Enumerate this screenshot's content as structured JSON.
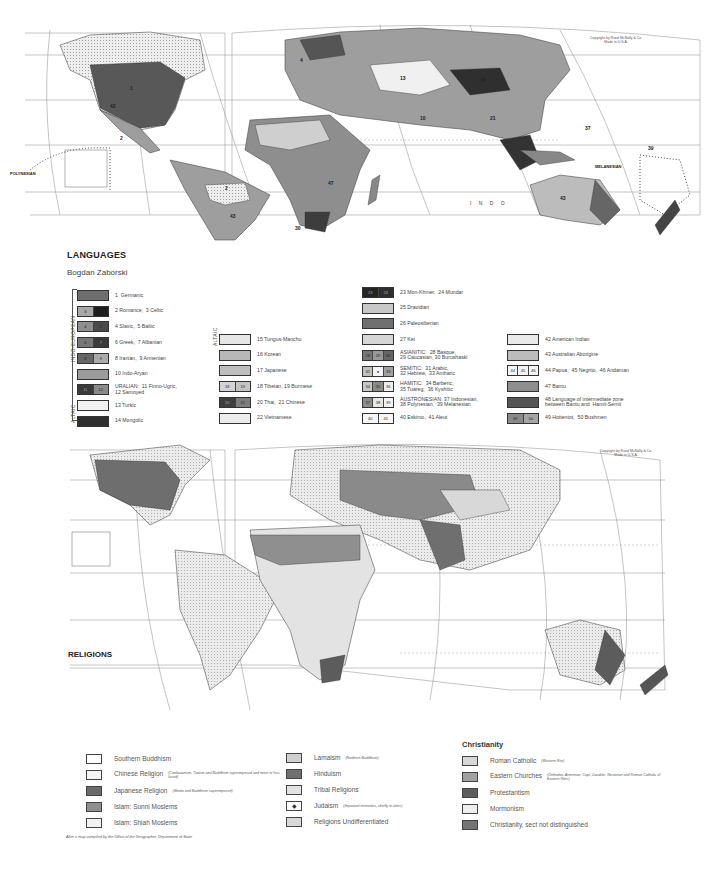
{
  "languages_map": {
    "title": "LANGUAGES",
    "author": "Bogdan Zaborski",
    "copyright": [
      "Copyright by Rand McNally & Co.",
      "Made in U.S.A."
    ],
    "ocean_labels": {
      "indo": "I N D O",
      "polynesian": "POLYNESIAN",
      "melanesian": "MELANESIAN",
      "polynesian_vertical": "POLYNESIAN",
      "equator": "Equator",
      "tropic_cancer": "Tropic of Cancer",
      "tropic_capricorn": "Tropic of Capricorn",
      "longitude_98w": "98 W"
    },
    "region_numbers": [
      "1",
      "2",
      "3",
      "4",
      "10",
      "13",
      "14",
      "15",
      "16",
      "21",
      "25",
      "27",
      "28",
      "31",
      "33",
      "34",
      "37",
      "38",
      "39",
      "40",
      "41",
      "42",
      "43",
      "44",
      "45",
      "46",
      "47",
      "48",
      "49",
      "50"
    ],
    "legend": {
      "group_indo_european": "INDO-EUROPEAN",
      "group_altaic_1": "ALTAIC",
      "group_altaic_2": "ALTAIC",
      "col1": [
        {
          "nums": [
            ""
          ],
          "label": "1  Germanic",
          "colors": [
            "#6e6e6e"
          ]
        },
        {
          "nums": [
            "3",
            ""
          ],
          "label": "2 Romance,  3 Celtic",
          "colors": [
            "#a9a9a9",
            "#1e1e1e"
          ]
        },
        {
          "nums": [
            "4",
            "5"
          ],
          "label": "4 Slavic,  5 Baltic",
          "colors": [
            "#8f8f8f",
            "#4a4a4a"
          ]
        },
        {
          "nums": [
            "6",
            "7"
          ],
          "label": "6 Greek,  7 Albanian",
          "colors": [
            "#777",
            "#3a3a3a"
          ]
        },
        {
          "nums": [
            "8",
            "9"
          ],
          "label": "8 Iranian,  9 Armenian",
          "colors": [
            "#666",
            "#aaa"
          ]
        },
        {
          "nums": [
            ""
          ],
          "label": "10 Indo-Aryan",
          "colors": [
            "#9b9b9b"
          ]
        },
        {
          "nums": [
            "11",
            "12"
          ],
          "label": "URALIAN:  11 Finno-Ugric,\n12 Samoyed",
          "colors": [
            "#3a3a3a",
            "#8a8a8a"
          ]
        },
        {
          "nums": [
            ""
          ],
          "label": "13 Turkic",
          "colors": [
            "#f0f0f0"
          ]
        },
        {
          "nums": [
            ""
          ],
          "label": "14 Mongolic",
          "colors": [
            "#2f2f2f"
          ]
        }
      ],
      "col2": [
        {
          "nums": [
            ""
          ],
          "label": "15 Tungus-Manchu",
          "colors": [
            "#e6e6e6"
          ]
        },
        {
          "nums": [
            ""
          ],
          "label": "16 Korean",
          "colors": [
            "#b8b8b8"
          ]
        },
        {
          "nums": [
            ""
          ],
          "label": "17 Japanese",
          "colors": [
            "#bdbdbd"
          ]
        },
        {
          "nums": [
            "18",
            "19"
          ],
          "label": "18 Tibetan, 19 Burmese",
          "colors": [
            "#d4d4d4",
            "#c4c4c4"
          ]
        },
        {
          "nums": [
            "20",
            "21"
          ],
          "label": "20 Thai,  21 Chinese",
          "colors": [
            "#3f3f3f",
            "#7e7e7e"
          ]
        },
        {
          "nums": [
            ""
          ],
          "label": "22 Vietnamese",
          "colors": [
            "#ececec"
          ]
        }
      ],
      "col3": [
        {
          "nums": [
            "23",
            "24"
          ],
          "label": "23 Mon-Khmer,  24 Mundar",
          "colors": [
            "#242424",
            "#2e2e2e"
          ]
        },
        {
          "nums": [
            ""
          ],
          "label": "25 Dravidian",
          "colors": [
            "#c8c8c8"
          ]
        },
        {
          "nums": [
            ""
          ],
          "label": "26 Paleosiberian",
          "colors": [
            "#707070"
          ]
        },
        {
          "nums": [
            ""
          ],
          "label": "27 Ket",
          "colors": [
            "#d6d6d6"
          ]
        },
        {
          "nums": [
            "28",
            "29",
            "30"
          ],
          "label": "ASIANITIC:  28 Basque,\n29 Caucasian, 30 Burushaski",
          "colors": [
            "#777",
            "#999",
            "#666"
          ]
        },
        {
          "nums": [
            "31",
            "●",
            "33"
          ],
          "label": "SEMITIC:  31 Arabic,\n32 Hebrew,  33 Amharic",
          "colors": [
            "#c0c0c0",
            "#f4f4f4",
            "#a0a0a0"
          ]
        },
        {
          "nums": [
            "34",
            "35",
            "36"
          ],
          "label": "HAMITIC:  34 Barberic,\n35 Tuareg,  36 Kyshitic",
          "colors": [
            "#c8c8c8",
            "#8a8a8a",
            "#eee"
          ]
        },
        {
          "nums": [
            "37",
            "38",
            "39"
          ],
          "label": "AUSTRONESIAN: 37 Indonesian,\n38 Polynesian,  39 Melanesian",
          "colors": [
            "#8c8c8c",
            "#e8e8e8",
            "#f2f2f2"
          ]
        },
        {
          "nums": [
            "40",
            "41"
          ],
          "label": "40 Eskimo,  41 Aleut",
          "colors": [
            "#f7f7f7",
            "#f7f7f7"
          ]
        }
      ],
      "col4": [
        {
          "nums": [
            ""
          ],
          "label": "42 American Indian",
          "colors": [
            "#eaeaea"
          ]
        },
        {
          "nums": [
            ""
          ],
          "label": "43 Australian Aborigine",
          "colors": [
            "#bcbcbc"
          ]
        },
        {
          "nums": [
            "44",
            "45",
            "46"
          ],
          "label": "44 Papua,  45 Negrito,  46 Andaman",
          "colors": [
            "#f5f5f5",
            "#f5f5f5",
            "#f5f5f5"
          ]
        },
        {
          "nums": [
            ""
          ],
          "label": "47 Bantu",
          "colors": [
            "#8e8e8e"
          ]
        },
        {
          "nums": [
            ""
          ],
          "label": "48 Language of intermediate zone\nbetween Bantu and  Hamit-Semit",
          "colors": [
            "#555"
          ]
        },
        {
          "nums": [
            "49",
            "50"
          ],
          "label": "49 Hottentot,  50 Bushmen",
          "colors": [
            "#8a8a8a",
            "#a5a5a5"
          ]
        }
      ]
    }
  },
  "religions_map": {
    "title": "RELIGIONS",
    "copyright": [
      "Copyright by Rand McNally & Co.",
      "Made in U.S.A."
    ],
    "map_labels": {
      "tropic_cancer": "Tropic of Cancer",
      "tropic_capricorn": "Tropic of Capricorn",
      "equator": "Equator",
      "longitude_98w": "98 W"
    },
    "legend": {
      "col1": [
        {
          "label": "Southern Buddhism",
          "note": "",
          "color": "#ffffff"
        },
        {
          "label": "Chinese Religion",
          "note": "(Confucianism, Taoism and Buddhism superimposed and more or less fused)",
          "color": "#f6f6f6"
        },
        {
          "label": "Japanese Religion",
          "note": "(Shinto and Buddhism superimposed)",
          "color": "#6a6a6a"
        },
        {
          "label": "Islam: Sunni Moslems",
          "note": "",
          "color": "#8f8f8f"
        },
        {
          "label": "Islam: Shiah Moslems",
          "note": "",
          "color": "#f2f2f2"
        }
      ],
      "col2": [
        {
          "label": "Lamaism",
          "note": "(Northern Buddhism)",
          "color": "#d0d0d0"
        },
        {
          "label": "Hinduism",
          "note": "",
          "color": "#6f6f6f"
        },
        {
          "label": "Tribal Religions",
          "note": "",
          "color": "#e3e3e3"
        },
        {
          "label": "Judaism",
          "note": "(Important minorities, chiefly in cities)",
          "color": "#ffffff"
        },
        {
          "label": "Religions Undifferentiated",
          "note": "",
          "color": "#d8d8d8"
        }
      ],
      "christianity": {
        "heading": "Christianity",
        "items": [
          {
            "label": "Roman Catholic",
            "note": "(Western Rite)",
            "color": "#d7d7d7"
          },
          {
            "label": "Eastern Churches",
            "note": "(Orthodox, Armenian, Copt, Jacobite, Nestorian and Roman Catholic of Eastern Rites)",
            "color": "#a0a0a0"
          },
          {
            "label": "Protestantism",
            "note": "",
            "color": "#5c5c5c"
          },
          {
            "label": "Mormonism",
            "note": "",
            "color": "#ededed"
          },
          {
            "label": "Christianity, sect not distinguished",
            "note": "",
            "color": "#747474"
          }
        ]
      }
    },
    "credit": "After a map compiled by the Office of the Geographer, Department of State"
  }
}
